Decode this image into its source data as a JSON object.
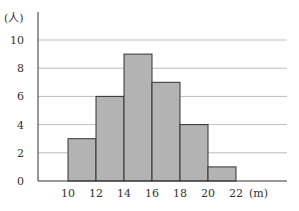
{
  "chart_data": {
    "type": "bar",
    "subtype": "histogram",
    "title": "",
    "xlabel": "(m)",
    "ylabel": "(人)",
    "bin_edges": [
      10,
      12,
      14,
      16,
      18,
      20,
      22
    ],
    "categories": [
      "10-12",
      "12-14",
      "14-16",
      "16-18",
      "18-20",
      "20-22"
    ],
    "values": [
      3,
      6,
      9,
      7,
      4,
      1
    ],
    "x_ticks": [
      "10",
      "12",
      "14",
      "16",
      "18",
      "20",
      "22"
    ],
    "y_ticks": [
      "0",
      "2",
      "4",
      "6",
      "8",
      "10"
    ],
    "ylim": [
      0,
      10
    ],
    "grid": true,
    "bar_color": "#b3b3b3",
    "bar_edge_color": "#333333"
  }
}
